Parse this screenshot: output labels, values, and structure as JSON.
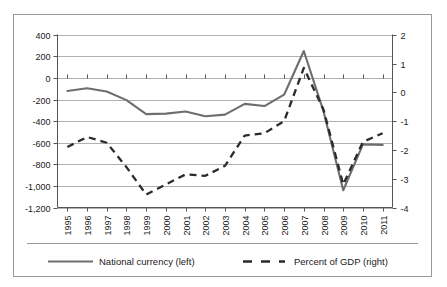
{
  "chart_data": {
    "type": "line",
    "title": "",
    "xlabel": "",
    "categories": [
      "1995",
      "1996",
      "1997",
      "1998",
      "1999",
      "2000",
      "2001",
      "2002",
      "2003",
      "2004",
      "2005",
      "2006",
      "2007",
      "2008",
      "2009",
      "2010",
      "2011"
    ],
    "grid": true,
    "legend_position": "bottom",
    "series": [
      {
        "name": "National currency (left)",
        "axis": "left",
        "style": "solid",
        "color": "#6e6e6e",
        "ylabel": "National currency",
        "ylim": [
          -1200,
          400
        ],
        "yticks": [
          "400",
          "200",
          "0",
          "-200",
          "-400",
          "-600",
          "-800",
          "-1,000",
          "-1,200"
        ],
        "ytick_values": [
          400,
          200,
          0,
          -200,
          -400,
          -600,
          -800,
          -1000,
          -1200
        ],
        "values": [
          -120,
          -95,
          -125,
          -205,
          -335,
          -330,
          -310,
          -355,
          -340,
          -240,
          -260,
          -155,
          250,
          -310,
          -1040,
          -615,
          -620
        ]
      },
      {
        "name": "Percent of GDP (right)",
        "axis": "right",
        "style": "dashed",
        "color": "#2b2b2b",
        "ylabel": "Percent of GDP",
        "ylim": [
          -4,
          2
        ],
        "yticks": [
          "2",
          "1",
          "0",
          "-1",
          "-2",
          "-3",
          "-4"
        ],
        "ytick_values": [
          2,
          1,
          0,
          -1,
          -2,
          -3,
          -4
        ],
        "values": [
          -1.9,
          -1.55,
          -1.75,
          -2.6,
          -3.55,
          -3.2,
          -2.85,
          -2.9,
          -2.55,
          -1.5,
          -1.42,
          -1.0,
          0.85,
          -0.6,
          -3.2,
          -1.72,
          -1.42
        ]
      }
    ]
  },
  "legend": {
    "items": [
      {
        "label": "National currency (left)",
        "style": "solid"
      },
      {
        "label": "Percent of GDP (right)",
        "style": "dashed"
      }
    ]
  }
}
